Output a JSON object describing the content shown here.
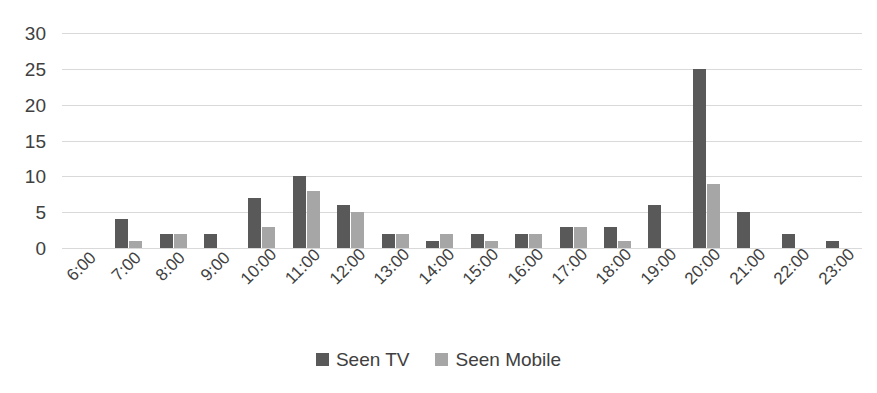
{
  "chart_data": {
    "type": "bar",
    "title": "",
    "xlabel": "",
    "ylabel": "",
    "ylim": [
      0,
      30
    ],
    "yticks": [
      30,
      25,
      20,
      15,
      10,
      5,
      0
    ],
    "grid": true,
    "legend_position": "bottom",
    "categories": [
      "6:00",
      "7:00",
      "8:00",
      "9:00",
      "10:00",
      "11:00",
      "12:00",
      "13:00",
      "14:00",
      "15:00",
      "16:00",
      "17:00",
      "18:00",
      "19:00",
      "20:00",
      "21:00",
      "22:00",
      "23:00"
    ],
    "series": [
      {
        "name": "Seen TV",
        "color": "#595959",
        "values": [
          0,
          4,
          2,
          2,
          7,
          10,
          6,
          2,
          1,
          2,
          2,
          3,
          3,
          6,
          25,
          5,
          2,
          1
        ]
      },
      {
        "name": "Seen Mobile",
        "color": "#a6a6a6",
        "values": [
          0,
          1,
          2,
          0,
          3,
          8,
          5,
          2,
          2,
          1,
          2,
          3,
          1,
          0,
          9,
          0,
          0,
          0
        ]
      }
    ]
  },
  "colors": {
    "series_tv": "#595959",
    "series_mobile": "#a6a6a6",
    "gridline": "#d9d9d9",
    "text": "#404040",
    "background": "#ffffff"
  }
}
